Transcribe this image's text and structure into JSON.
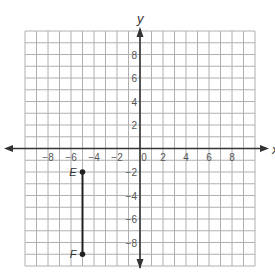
{
  "chart_data": {
    "type": "scatter",
    "title": "",
    "xlabel": "x",
    "ylabel": "y",
    "xlim": [
      -10,
      10
    ],
    "ylim": [
      -10,
      10
    ],
    "grid": true,
    "grid_step": 1,
    "x_ticks": [
      -8,
      -6,
      -4,
      -2,
      0,
      2,
      4,
      6,
      8
    ],
    "y_ticks": [
      8,
      6,
      4,
      2,
      -2,
      -4,
      -6,
      -8
    ],
    "points": [
      {
        "label": "E",
        "x": -5,
        "y": -2
      },
      {
        "label": "F",
        "x": -5,
        "y": -9
      }
    ],
    "segments": [
      {
        "from": "E",
        "to": "F"
      }
    ],
    "legend": null
  },
  "colors": {
    "grid": "#b0b0b0",
    "axis": "#333333",
    "segment": "#222222",
    "point": "#222222",
    "tick_text": "#555555"
  }
}
